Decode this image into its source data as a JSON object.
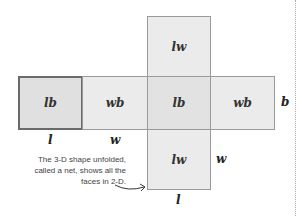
{
  "diagram": {
    "faces": {
      "top": "lw",
      "left": "lb",
      "left_middle": "wb",
      "center": "lb",
      "right": "wb",
      "bottom": "lw"
    },
    "dimensions": {
      "left_width": "l",
      "left_middle_width": "w",
      "height_right": "b",
      "bottom_side": "w",
      "bottom_width": "l"
    },
    "caption": "The 3-D shape unfolded, called a net, shows all the faces in 2-D."
  },
  "colors": {
    "face_fill": "#ebebeb",
    "face_border": "#9a9a9a",
    "highlight_border": "#6a6a6a"
  }
}
